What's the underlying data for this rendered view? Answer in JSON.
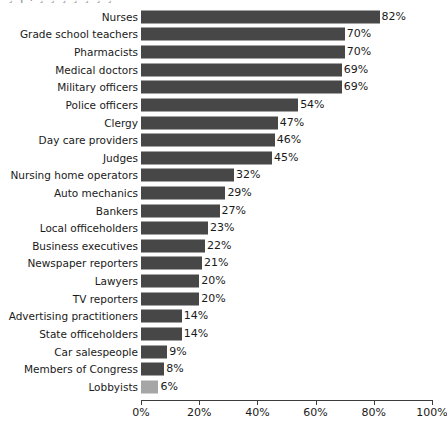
{
  "chart_data": {
    "type": "bar",
    "orientation": "horizontal",
    "title": "",
    "xlabel": "",
    "ylabel": "",
    "xlim": [
      0,
      100
    ],
    "xticks": [
      0,
      20,
      40,
      60,
      80,
      100
    ],
    "xtick_labels": [
      "0%",
      "20%",
      "40%",
      "60%",
      "80%",
      "100%"
    ],
    "grid": false,
    "legend": "none",
    "value_suffix": "%",
    "bar_color": "#474747",
    "highlight_color": "#a6a6a6",
    "categories": [
      "Nurses",
      "Grade school teachers",
      "Pharmacists",
      "Medical doctors",
      "Military officers",
      "Police officers",
      "Clergy",
      "Day care providers",
      "Judges",
      "Nursing home operators",
      "Auto mechanics",
      "Bankers",
      "Local officeholders",
      "Business executives",
      "Newspaper reporters",
      "Lawyers",
      "TV reporters",
      "Advertising practitioners",
      "State officeholders",
      "Car salespeople",
      "Members of Congress",
      "Lobbyists"
    ],
    "values": [
      82,
      70,
      70,
      69,
      69,
      54,
      47,
      46,
      45,
      32,
      29,
      27,
      23,
      22,
      21,
      20,
      20,
      14,
      14,
      9,
      8,
      6
    ],
    "value_labels": [
      "82%",
      "70%",
      "70%",
      "69%",
      "69%",
      "54%",
      "47%",
      "46%",
      "45%",
      "32%",
      "29%",
      "27%",
      "23%",
      "22%",
      "21%",
      "20%",
      "20%",
      "14%",
      "14%",
      "9%",
      "8%",
      "6%"
    ],
    "highlight_index": 21
  },
  "top_clipped_text": "¸  ¡    ı      ¸  ¸  ¸   ¸   ¸  ¸   ¸"
}
